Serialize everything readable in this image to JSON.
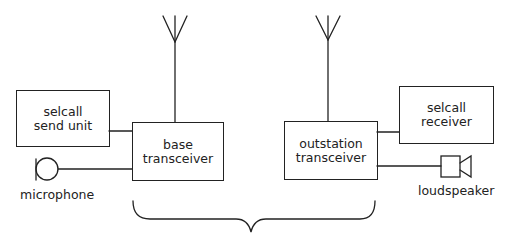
{
  "diagram": {
    "type": "block diagram",
    "blocks": {
      "selcall_send_unit": {
        "line1": "selcall",
        "line2": "send unit"
      },
      "base_transceiver": {
        "line1": "base",
        "line2": "transceiver"
      },
      "outstation_transceiver": {
        "line1": "outstation",
        "line2": "transceiver"
      },
      "selcall_receiver": {
        "line1": "selcall",
        "line2": "receiver"
      }
    },
    "components": {
      "microphone": {
        "label": "microphone",
        "icon": "microphone-icon"
      },
      "loudspeaker": {
        "label": "loudspeaker",
        "icon": "loudspeaker-icon"
      },
      "base_antenna": {
        "icon": "antenna-icon"
      },
      "outstation_antenna": {
        "icon": "antenna-icon"
      }
    },
    "connections": [
      {
        "from": "selcall send unit",
        "to": "base transceiver"
      },
      {
        "from": "microphone",
        "to": "base transceiver"
      },
      {
        "from": "base antenna",
        "to": "base transceiver"
      },
      {
        "from": "outstation antenna",
        "to": "outstation transceiver"
      },
      {
        "from": "outstation transceiver",
        "to": "selcall receiver"
      },
      {
        "from": "outstation transceiver",
        "to": "loudspeaker"
      }
    ],
    "grouping": {
      "type": "curly brace",
      "spans": [
        "base transceiver",
        "outstation transceiver"
      ]
    },
    "line_color": "#222222",
    "background": "#ffffff"
  }
}
